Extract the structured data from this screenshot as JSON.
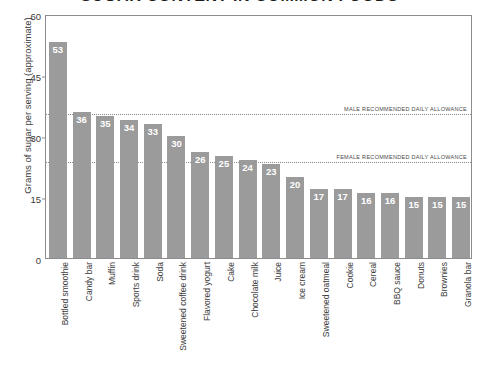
{
  "chart_data": {
    "type": "bar",
    "title": "SUGAR CONTENT IN COMMON FOODS",
    "xlabel": "",
    "ylabel": "Grams of sugar per serving (approximate)",
    "ylim": [
      0,
      60
    ],
    "yticks": [
      0,
      15,
      30,
      45,
      60
    ],
    "grid": false,
    "legend": "none",
    "bar_color": "#9b9b9b",
    "value_label_color": "#ffffff",
    "categories": [
      "Bottled smoothie",
      "Candy bar",
      "Muffin",
      "Sports drink",
      "Soda",
      "Sweetened coffee drink",
      "Flavored yogurt",
      "Cake",
      "Chocolate milk",
      "Juice",
      "Ice cream",
      "Sweetened oatmeal",
      "Cookie",
      "Cereal",
      "BBQ sauce",
      "Donuts",
      "Brownies",
      "Granola bar"
    ],
    "values": [
      53,
      36,
      35,
      34,
      33,
      30,
      26,
      25,
      24,
      23,
      20,
      17,
      17,
      16,
      16,
      15,
      15,
      15
    ],
    "annotations": [
      {
        "label": "MALE RECOMMENDED DAILY ALLOWANCE",
        "value": 36,
        "style": "dotted"
      },
      {
        "label": "FEMALE RECOMMENDED DAILY ALLOWANCE",
        "value": 24,
        "style": "dotted"
      }
    ]
  }
}
